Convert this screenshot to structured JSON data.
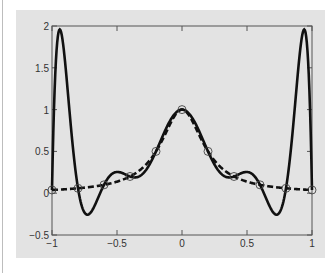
{
  "chart_data": {
    "type": "line",
    "title": "",
    "xlabel": "",
    "ylabel": "",
    "xlim": [
      -1,
      1
    ],
    "ylim": [
      -0.5,
      2
    ],
    "grid": false,
    "x_ticks": [
      "-1",
      "-0.5",
      "0",
      "0.5",
      "1"
    ],
    "x_tick_values": [
      -1,
      -0.5,
      0,
      0.5,
      1
    ],
    "y_ticks": [
      "-0.5",
      "0",
      "0.5",
      "1",
      "1.5",
      "2"
    ],
    "y_tick_values": [
      -0.5,
      0,
      0.5,
      1,
      1.5,
      2
    ],
    "series": [
      {
        "name": "data points f(x)=1/(1+25x^2)",
        "style": "circle markers",
        "x": [
          -1,
          -0.8,
          -0.6,
          -0.4,
          -0.2,
          0,
          0.2,
          0.4,
          0.6,
          0.8,
          1
        ],
        "y": [
          0.0385,
          0.0588,
          0.1,
          0.2,
          0.5,
          1.0,
          0.5,
          0.2,
          0.1,
          0.0588,
          0.0385
        ]
      },
      {
        "name": "10th-order interpolating polynomial",
        "style": "solid thick",
        "peaks": [
          {
            "x": -0.96,
            "y": 1.92
          },
          {
            "x": 0.96,
            "y": 1.92
          }
        ],
        "troughs": [
          {
            "x": -0.7,
            "y": -0.23
          },
          {
            "x": 0.7,
            "y": -0.23
          }
        ]
      },
      {
        "name": "Runge function 1/(1+25x^2)",
        "style": "dashed thick",
        "max": {
          "x": 0,
          "y": 1.0
        }
      }
    ]
  },
  "colors": {
    "panel": "#e3e3e3",
    "line": "#111111",
    "marker": "#444444"
  }
}
